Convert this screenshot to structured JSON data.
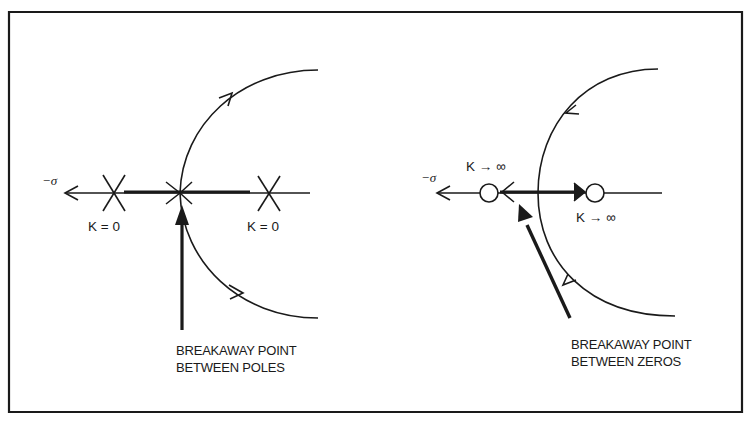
{
  "figure": {
    "border_color": "#1a1a1a",
    "background": "#ffffff",
    "ink": "#1a1a1a"
  },
  "left_panel": {
    "axis_label": "−σ",
    "pole_labels": [
      "K = 0",
      "K = 0"
    ],
    "caption_line1": "BREAKAWAY POINT",
    "caption_line2": "BETWEEN POLES"
  },
  "right_panel": {
    "axis_label": "−σ",
    "zero_labels": [
      "K → ∞",
      "K → ∞"
    ],
    "caption_line1": "BREAKAWAY POINT",
    "caption_line2": "BETWEEN ZEROS"
  }
}
